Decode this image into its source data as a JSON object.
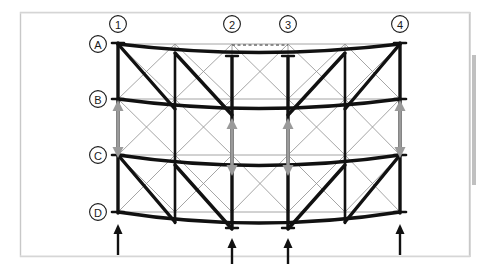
{
  "figure": {
    "background_color": "#ffffff",
    "border_color": "#c8c8c8",
    "right_shadow_color": "#8c8c8c",
    "frame": {
      "x": 20,
      "y": 12,
      "width": 450,
      "height": 245
    }
  },
  "colors": {
    "deformed_member": "#111111",
    "undeformed_member": "#8e8e8e",
    "displacement_arrow": "#9a9a9a",
    "reaction_arrow": "#111111",
    "dashed_reference": "#6d6d6d",
    "label_circle_stroke": "#1a1a1a",
    "label_text": "#1a1a1a"
  },
  "grid": {
    "column_labels": [
      "1",
      "2",
      "3",
      "4"
    ],
    "column_label_glyphs": [
      "①",
      "②",
      "③",
      "④"
    ],
    "column_x": [
      118,
      232,
      288,
      400
    ],
    "column_label_y": 24,
    "row_labels": [
      "A",
      "B",
      "C",
      "D"
    ],
    "row_x": 98,
    "row_y": [
      44,
      99,
      155,
      212
    ],
    "intermediate_column_x": [
      175,
      345
    ]
  },
  "undeformed_structure": {
    "description": "Thin gray lines showing the original undeformed geometry",
    "stroke_width": 0.8,
    "node_x": [
      118,
      175,
      232,
      288,
      345,
      400
    ],
    "node_y": [
      44,
      99,
      155,
      212
    ],
    "braced_bays": [
      "1-mid1",
      "mid1-2",
      "3-mid2",
      "mid2-4"
    ]
  },
  "deformed_structure": {
    "description": "Thick black lines showing the deformed shape with sagging chords",
    "stroke_width": 3.4,
    "chord_sag": {
      "A": 10,
      "B": 12,
      "C": 12,
      "D": 12
    },
    "chords": [
      {
        "level": "A",
        "label": "Top chord A"
      },
      {
        "level": "B",
        "label": "Chord B"
      },
      {
        "level": "C",
        "label": "Chord C"
      },
      {
        "level": "D",
        "label": "Bottom chord D"
      }
    ],
    "diagonals_direction": "down-right in left half, up-right in right half"
  },
  "displacement_arrows": {
    "label": "Relative storey displacement (B to C)",
    "color": "#9a9a9a",
    "columns": [
      "1",
      "2",
      "3",
      "4"
    ],
    "x_positions": [
      118,
      232,
      288,
      400
    ],
    "top_y": 101,
    "bottom_y": 158,
    "style": "double-ended, up arrow at B and down arrow at C"
  },
  "reaction_arrows": {
    "label": "Support reactions",
    "color": "#111111",
    "direction": "up",
    "count": 4,
    "columns": [
      "1",
      "2",
      "3",
      "4"
    ],
    "x_positions": [
      118,
      232,
      288,
      400
    ],
    "base_y": 255,
    "tip_y": 228
  },
  "reference_lines": [
    {
      "name": "top-dashed-reference",
      "x1": 232,
      "x2": 288,
      "y": 45,
      "level": "A"
    },
    {
      "name": "bottom-dashed-reference",
      "x1": 232,
      "x2": 288,
      "y": 222,
      "level": "D"
    }
  ]
}
